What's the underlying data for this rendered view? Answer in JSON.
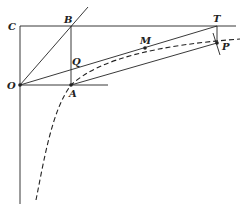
{
  "diagram": {
    "type": "geometric construction",
    "points": {
      "O": {
        "label": "O",
        "x": 20,
        "y": 85
      },
      "A": {
        "label": "A",
        "x": 71,
        "y": 85
      },
      "B": {
        "label": "B",
        "x": 71,
        "y": 26
      },
      "C": {
        "label": "C",
        "x": 20,
        "y": 26
      },
      "Q": {
        "label": "Q",
        "x": 71,
        "y": 68
      },
      "M": {
        "label": "M",
        "x": 145,
        "y": 48
      },
      "T": {
        "label": "T",
        "x": 217,
        "y": 26
      },
      "P": {
        "label": "P",
        "x": 217,
        "y": 43
      }
    },
    "curve": "dashed hyperbola-like curve through A and P"
  }
}
